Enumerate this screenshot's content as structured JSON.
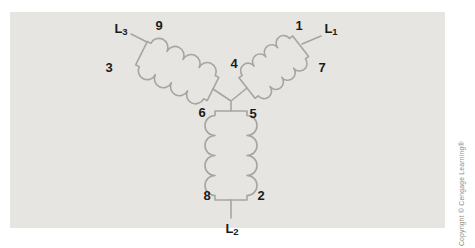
{
  "diagram": {
    "labels": {
      "t1": "1",
      "t2": "2",
      "t3": "3",
      "t4": "4",
      "t5": "5",
      "t6": "6",
      "t7": "7",
      "t8": "8",
      "t9": "9",
      "L1_main": "L",
      "L1_sub": "1",
      "L2_main": "L",
      "L2_sub": "2",
      "L3_main": "L",
      "L3_sub": "3"
    },
    "colors": {
      "panel_bg": "#e6e5e1",
      "coil_stroke": "#a5a5a1",
      "label_text": "#1b1b1b",
      "copyright_text": "#8b8b89"
    },
    "copyright": "Copyright © Cengage Learning®"
  }
}
